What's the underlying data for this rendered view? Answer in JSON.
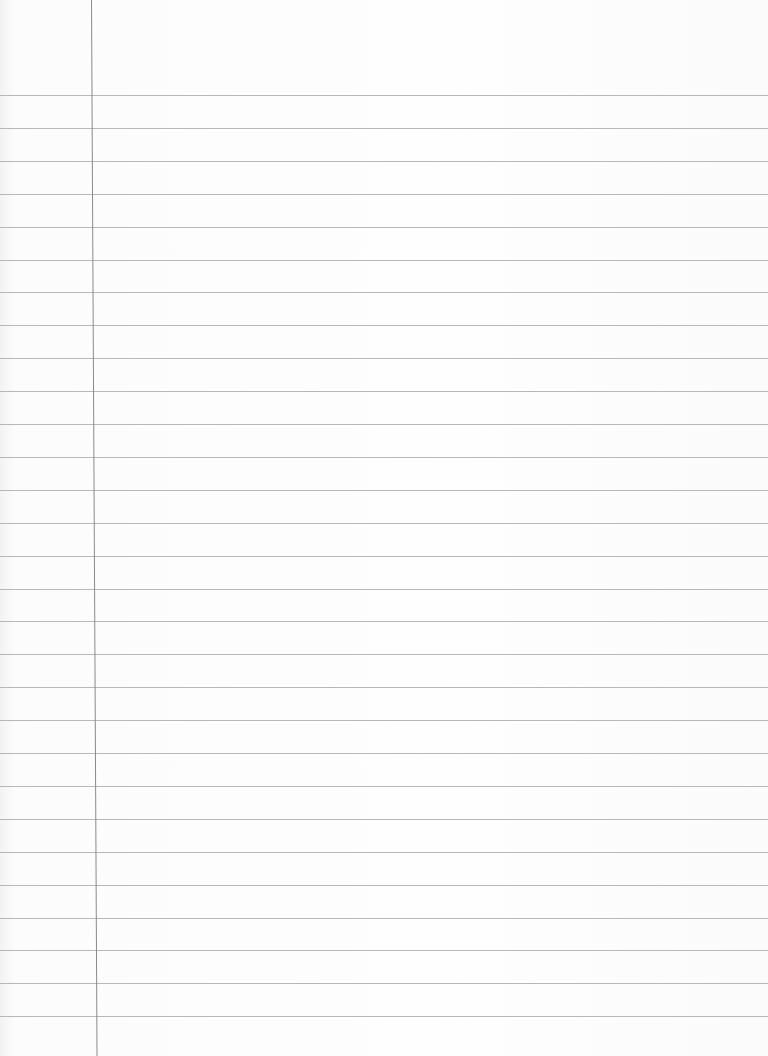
{
  "paper": {
    "type": "lined-notebook-page",
    "background_color": "#fdfdfd",
    "rule_color": "#a9acb0",
    "margin_color": "#8a8a8a",
    "margin_x": 91,
    "first_rule_y": 95,
    "rule_spacing": 32.9,
    "rule_count": 29,
    "text": []
  }
}
